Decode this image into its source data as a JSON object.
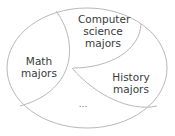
{
  "diagram": {
    "type": "partition-of-set",
    "regions": [
      {
        "id": "math",
        "lines": [
          "Math",
          "majors"
        ]
      },
      {
        "id": "cs",
        "lines": [
          "Computer",
          "science",
          "majors"
        ]
      },
      {
        "id": "history",
        "lines": [
          "History",
          "majors"
        ]
      },
      {
        "id": "other",
        "lines": [
          "..."
        ]
      }
    ],
    "colors": {
      "stroke": "#b8b8b8",
      "text": "#3a3a3a",
      "background": "#ffffff"
    }
  }
}
